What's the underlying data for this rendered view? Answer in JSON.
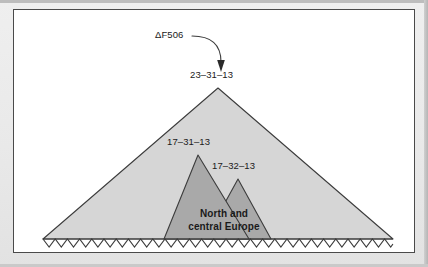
{
  "figure": {
    "type": "conceptual-diagram",
    "background_color": "#ffffff",
    "mat_color": "#e9e9e9",
    "border_color": "#4a4a4a",
    "outer_fill_color": "#d6d6d6",
    "inner_fill_color": "#a9a9a9",
    "stroke_color": "#3c3c3c",
    "baseline_style": "zigzag"
  },
  "annotation": {
    "pointer_label": "ΔF506",
    "pointer_icon": "curved-arrow-icon",
    "points_to": "23–31–13"
  },
  "peaks": [
    {
      "id": "outer",
      "label": "23–31–13",
      "fill": "#d6d6d6",
      "apex": {
        "x": 217,
        "y": 87
      }
    },
    {
      "id": "inner-left",
      "label": "17–31–13",
      "fill": "#a9a9a9",
      "apex": {
        "x": 197,
        "y": 154
      }
    },
    {
      "id": "inner-right",
      "label": "17–32–13",
      "fill": "#a9a9a9",
      "apex": {
        "x": 237,
        "y": 178
      }
    }
  ],
  "region_label": {
    "line1": "North and",
    "line2": "central Europe"
  }
}
